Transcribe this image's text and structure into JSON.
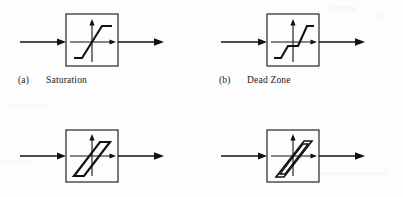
{
  "figure": {
    "background_color": "#fdfdfd",
    "line_color": "#111111",
    "grid": {
      "columns": 2,
      "rows": 2
    }
  },
  "cells": [
    {
      "id": "saturation",
      "caption_tag": "(a)",
      "caption_text": "Saturation",
      "caption_visible": true,
      "symbol": "saturation-curve",
      "description": "flat-rising-flat piecewise linear characteristic"
    },
    {
      "id": "dead-zone",
      "caption_tag": "(b)",
      "caption_text": "Dead Zone",
      "caption_visible": true,
      "symbol": "dead-zone-curve",
      "description": "flat segment through origin with rising segments offset to each side"
    },
    {
      "id": "hysteresis",
      "caption_tag": "",
      "caption_text": "",
      "caption_visible": false,
      "symbol": "hysteresis-loop",
      "description": "tall narrow parallelogram loop through origin"
    },
    {
      "id": "backlash",
      "caption_tag": "",
      "caption_text": "",
      "caption_visible": false,
      "symbol": "backlash-loop",
      "description": "double-outlined parallelogram loop through origin"
    }
  ]
}
